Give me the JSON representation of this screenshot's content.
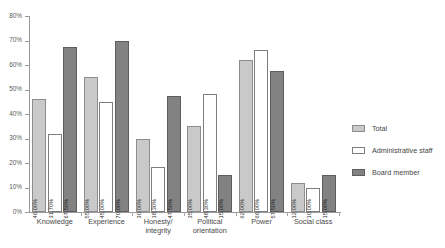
{
  "chart_data": {
    "type": "bar",
    "title": "",
    "xlabel": "",
    "ylabel": "",
    "ylim": [
      0,
      80
    ],
    "ytick_labels": [
      "0%",
      "10%",
      "20%",
      "30%",
      "40%",
      "50%",
      "60%",
      "70%",
      "80%"
    ],
    "ytick_values": [
      0,
      10,
      20,
      30,
      40,
      50,
      60,
      70,
      80
    ],
    "grid": false,
    "legend_position": "right",
    "categories": [
      "Knowledge",
      "Experience",
      "Honesty/ integrity",
      "Political orientation",
      "Power",
      "Social class"
    ],
    "category_lines": [
      [
        "Knowledge"
      ],
      [
        "Experience"
      ],
      [
        "Honesty/",
        "integrity"
      ],
      [
        "Political",
        "orientation"
      ],
      [
        "Power"
      ],
      [
        "Social class"
      ]
    ],
    "series": [
      {
        "name": "Total",
        "color": "#c9c9c9",
        "values": [
          46.0,
          55.0,
          30.0,
          35.0,
          62.0,
          12.0
        ],
        "labels": [
          "46.00%",
          "55.00%",
          "30.00%",
          "35.00%",
          "62.00%",
          "12.00%"
        ]
      },
      {
        "name": "Administrative staff",
        "color": "#ffffff",
        "values": [
          31.7,
          45.0,
          18.3,
          48.3,
          66.0,
          10.0
        ],
        "labels": [
          "31.70%",
          "45.00%",
          "18.30%",
          "48.30%",
          "66.00%",
          "10.00%"
        ]
      },
      {
        "name": "Board member",
        "color": "#828282",
        "values": [
          67.5,
          70.0,
          47.5,
          15.0,
          57.5,
          15.0
        ],
        "labels": [
          "67.50%",
          "70.00%",
          "47.50%",
          "15.00%",
          "57.50%",
          "15.00%"
        ]
      }
    ]
  }
}
